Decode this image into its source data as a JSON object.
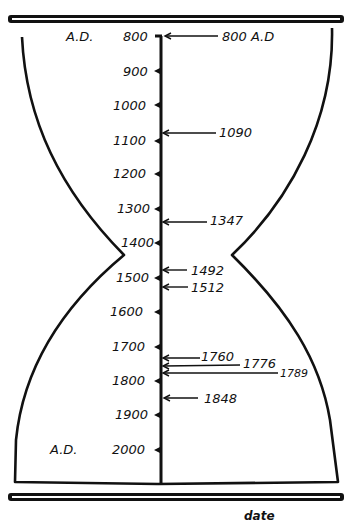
{
  "diagram": {
    "caption": "date",
    "top_era_label": "A.D.",
    "bottom_era_label": "A.D.",
    "axis": {
      "start": 800,
      "end": 2000,
      "ticks": [
        "800",
        "900",
        "1000",
        "1100",
        "1200",
        "1300",
        "1400",
        "1500",
        "1600",
        "1700",
        "1800",
        "1900",
        "2000"
      ]
    },
    "annotations": [
      {
        "label": "800 A.D",
        "year": 800
      },
      {
        "label": "1090",
        "year": 1090
      },
      {
        "label": "1347",
        "year": 1347
      },
      {
        "label": "1492",
        "year": 1492
      },
      {
        "label": "1512",
        "year": 1512
      },
      {
        "label": "1760",
        "year": 1760
      },
      {
        "label": "1776",
        "year": 1776
      },
      {
        "label": "1789",
        "year": 1789
      },
      {
        "label": "1848",
        "year": 1848
      }
    ],
    "colors": {
      "ink": "#111111",
      "background": "#ffffff"
    }
  }
}
